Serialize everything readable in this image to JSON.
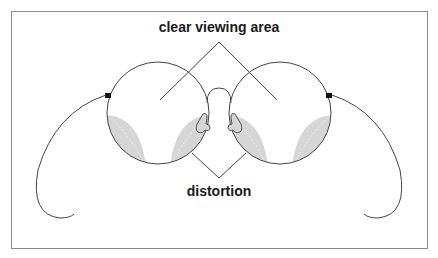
{
  "diagram": {
    "labels": {
      "top": "clear viewing area",
      "bottom": "distortion"
    },
    "colors": {
      "frame_border": "#888888",
      "line": "#333333",
      "distortion_fill": "#d6d6d6",
      "hinge": "#111111",
      "background": "#ffffff"
    }
  }
}
